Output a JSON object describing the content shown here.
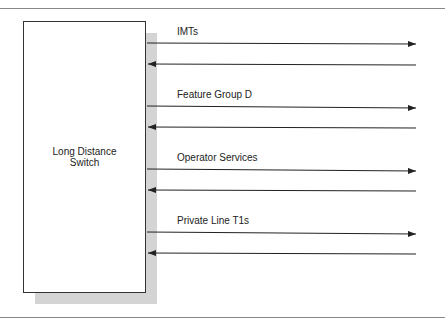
{
  "switch": {
    "label_line1": "Long Distance",
    "label_line2": "Switch"
  },
  "channels": [
    {
      "label": "IMTs"
    },
    {
      "label": "Feature Group D"
    },
    {
      "label": "Operator Services"
    },
    {
      "label": "Private Line T1s"
    }
  ],
  "colors": {
    "line": "#222222",
    "shadow": "#d4d4d4",
    "rule": "#888888"
  }
}
